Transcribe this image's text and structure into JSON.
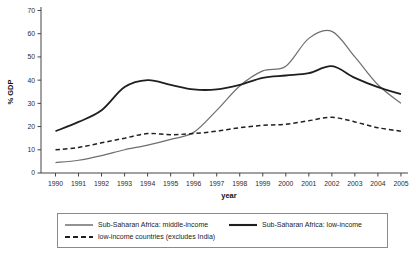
{
  "chart_data": {
    "type": "line",
    "title": "",
    "xlabel": "year",
    "ylabel": "% GDP",
    "x": [
      1990,
      1991,
      1992,
      1993,
      1994,
      1995,
      1996,
      1997,
      1998,
      1999,
      2000,
      2001,
      2002,
      2003,
      2004,
      2005
    ],
    "ylim": [
      0,
      70
    ],
    "yticks": [
      0,
      10,
      20,
      30,
      40,
      50,
      60,
      70
    ],
    "grid": false,
    "legend_position": "bottom-boxed",
    "axis_color": "#444444",
    "series": [
      {
        "id": "ssa-middle-income",
        "name": "Sub-Saharan Africa: middle-income",
        "style": "solid",
        "color": "#6e6e6e",
        "width": 1.2,
        "values": [
          4.5,
          5.5,
          7.5,
          10,
          12,
          14.5,
          17.5,
          27,
          37.5,
          44,
          46,
          58,
          61,
          50,
          38,
          30
        ]
      },
      {
        "id": "ssa-low-income",
        "name": "Sub-Saharan Africa: low-income",
        "style": "solid",
        "color": "#1f1f1f",
        "width": 1.8,
        "values": [
          18,
          22,
          27,
          37,
          40,
          38,
          36,
          36,
          38,
          41,
          42,
          43,
          46,
          41,
          37,
          34
        ]
      },
      {
        "id": "low-income-excl-india",
        "name": "low-income countries (excludes India)",
        "style": "dashed",
        "color": "#1f1f1f",
        "width": 1.5,
        "values": [
          10,
          11,
          13,
          15,
          17,
          16.5,
          17,
          18,
          19.5,
          20.5,
          21,
          22.5,
          24,
          22,
          19.5,
          18
        ]
      }
    ]
  }
}
